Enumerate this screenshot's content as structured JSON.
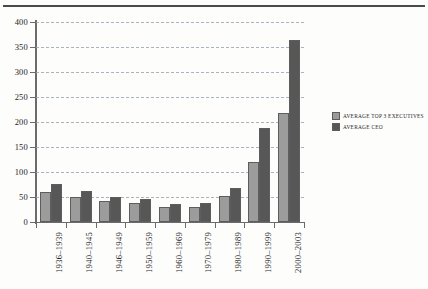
{
  "chart_data": {
    "type": "bar",
    "title": "",
    "subtitle": "",
    "xlabel": "",
    "ylabel": "",
    "ylim": [
      0,
      400
    ],
    "ytick_step": 50,
    "yticks": [
      0,
      50,
      100,
      150,
      200,
      250,
      300,
      350,
      400
    ],
    "ytick_labels": [
      "0",
      "50",
      "100",
      "150",
      "200",
      "250",
      "300",
      "350",
      "400"
    ],
    "grid": true,
    "grid_style": "dashed-horizontal",
    "legend_position": "right-middle",
    "categories": [
      "1936–1939",
      "1940–1945",
      "1946–1949",
      "1950–1959",
      "1960–1969",
      "1970–1979",
      "1980–1989",
      "1990–1999",
      "2000–2003"
    ],
    "series": [
      {
        "name": "AVERAGE TOP 3 EXECUTIVES",
        "color": "#9c9c9c",
        "values": [
          60,
          50,
          42,
          38,
          30,
          31,
          53,
          120,
          218
        ]
      },
      {
        "name": "AVERAGE CEO",
        "color": "#575757",
        "values": [
          77,
          62,
          50,
          47,
          37,
          38,
          68,
          189,
          365
        ]
      }
    ],
    "annotations": []
  },
  "legend": {
    "items": [
      {
        "label": "AVERAGE TOP 3 EXECUTIVES",
        "swatch": "series-exec"
      },
      {
        "label": "AVERAGE CEO",
        "swatch": "series-ceo"
      }
    ]
  },
  "colors": {
    "series_exec": "#9c9c9c",
    "series_ceo": "#575757",
    "axis": "#6b6b6b",
    "grid": "#9aa7b5",
    "rule": "#4a4a4a",
    "background": "#fdfdfc"
  }
}
